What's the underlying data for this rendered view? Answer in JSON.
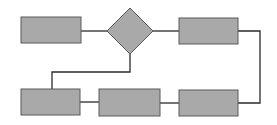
{
  "diagram": {
    "type": "flowchart",
    "colors": {
      "background": "#ffffff",
      "node_fill": "#a9a9a9",
      "node_stroke": "#5a5a5a",
      "edge": "#2b2b2b"
    },
    "nodes": [
      {
        "id": "box-top-left",
        "shape": "rectangle",
        "label": "",
        "x": 21,
        "y": 17,
        "w": 60,
        "h": 26
      },
      {
        "id": "decision",
        "shape": "diamond",
        "label": "",
        "cx": 130,
        "cy": 31,
        "rx": 23,
        "ry": 23
      },
      {
        "id": "box-top-right",
        "shape": "rectangle",
        "label": "",
        "x": 179,
        "y": 18,
        "w": 59,
        "h": 26
      },
      {
        "id": "box-bottom-left",
        "shape": "rectangle",
        "label": "",
        "x": 21,
        "y": 89,
        "w": 59,
        "h": 26
      },
      {
        "id": "box-bottom-middle",
        "shape": "rectangle",
        "label": "",
        "x": 99,
        "y": 89,
        "w": 61,
        "h": 27
      },
      {
        "id": "box-bottom-right",
        "shape": "rectangle",
        "label": "",
        "x": 179,
        "y": 90,
        "w": 59,
        "h": 26
      }
    ],
    "edges": [
      {
        "from": "box-top-left",
        "to": "decision",
        "points": "81,31 107,31"
      },
      {
        "from": "decision",
        "to": "box-top-right",
        "points": "153,31 179,31"
      },
      {
        "from": "box-top-right",
        "to": "box-bottom-right",
        "points": "238,31 260,31 260,103 238,103"
      },
      {
        "from": "decision",
        "to": "box-bottom-left",
        "points": "130,54 130,72 52,72 52,89"
      },
      {
        "from": "box-bottom-left",
        "to": "box-bottom-middle",
        "points": "80,102 99,102"
      },
      {
        "from": "box-bottom-middle",
        "to": "box-bottom-right",
        "points": "160,103 179,103"
      }
    ]
  }
}
